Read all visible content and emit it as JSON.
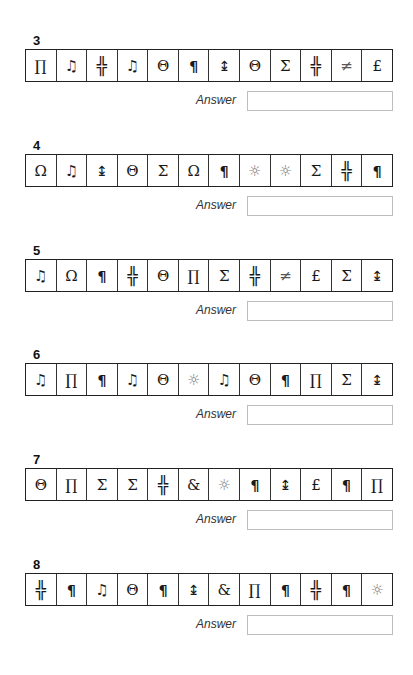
{
  "answer_label": "Answer",
  "questions": [
    {
      "number": "3",
      "top": 33,
      "symbols": [
        "∏",
        "♫",
        "╬",
        "♫",
        "Θ",
        "¶",
        "↨",
        "Θ",
        "Σ",
        "╬",
        "≠",
        "£"
      ],
      "kinds": [
        "pi",
        "music",
        "dbl",
        "music",
        "theta",
        "pilcrow",
        "updown",
        "theta",
        "sigma",
        "dbl",
        "neq",
        "pound"
      ],
      "answer_value": ""
    },
    {
      "number": "4",
      "top": 138,
      "symbols": [
        "Ω",
        "♫",
        "↨",
        "Θ",
        "Σ",
        "Ω",
        "¶",
        "☼",
        "☼",
        "Σ",
        "╬",
        "¶"
      ],
      "kinds": [
        "omega",
        "music",
        "updown",
        "theta",
        "sigma",
        "omega",
        "pilcrow",
        "sun",
        "sun",
        "sigma",
        "dbl",
        "pilcrow"
      ],
      "answer_value": ""
    },
    {
      "number": "5",
      "top": 243,
      "symbols": [
        "♫",
        "Ω",
        "¶",
        "╬",
        "Θ",
        "∏",
        "Σ",
        "╬",
        "≠",
        "£",
        "Σ",
        "↨"
      ],
      "kinds": [
        "music",
        "omega",
        "pilcrow",
        "dbl",
        "theta",
        "pi",
        "sigma",
        "dbl",
        "neq",
        "pound",
        "sigma",
        "updown"
      ],
      "answer_value": ""
    },
    {
      "number": "6",
      "top": 347,
      "symbols": [
        "♫",
        "∏",
        "¶",
        "♫",
        "Θ",
        "☼",
        "♫",
        "Θ",
        "¶",
        "∏",
        "Σ",
        "↨"
      ],
      "kinds": [
        "music",
        "pi",
        "pilcrow",
        "music",
        "theta",
        "sun",
        "music",
        "theta",
        "pilcrow",
        "pi",
        "sigma",
        "updown"
      ],
      "answer_value": ""
    },
    {
      "number": "7",
      "top": 452,
      "symbols": [
        "Θ",
        "∏",
        "Σ",
        "Σ",
        "╬",
        "&",
        "☼",
        "¶",
        "↨",
        "£",
        "¶",
        "∏"
      ],
      "kinds": [
        "theta",
        "pi",
        "sigma",
        "sigma",
        "dbl",
        "ampersand",
        "sun",
        "pilcrow",
        "updown",
        "pound",
        "pilcrow",
        "pi"
      ],
      "answer_value": ""
    },
    {
      "number": "8",
      "top": 557,
      "symbols": [
        "╬",
        "¶",
        "♫",
        "Θ",
        "¶",
        "↨",
        "&",
        "∏",
        "¶",
        "╬",
        "¶",
        "☼"
      ],
      "kinds": [
        "dbl",
        "pilcrow",
        "music",
        "theta",
        "pilcrow",
        "updown",
        "ampersand",
        "pi",
        "pilcrow",
        "dbl",
        "pilcrow",
        "sun"
      ],
      "answer_value": ""
    }
  ]
}
